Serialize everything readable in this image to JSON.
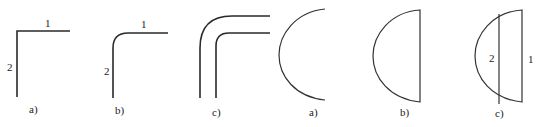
{
  "figure_left": {
    "panels": [
      {
        "id": "a",
        "caption": "a)",
        "shape": "sharp-corner",
        "labels": {
          "horizontal": "1",
          "vertical": "2"
        }
      },
      {
        "id": "b",
        "caption": "b)",
        "shape": "rounded-corner",
        "labels": {
          "horizontal": "1",
          "vertical": "2"
        }
      },
      {
        "id": "c",
        "caption": "c)",
        "shape": "double-rounded-corner"
      }
    ]
  },
  "figure_right": {
    "panels": [
      {
        "id": "a",
        "caption": "a)",
        "shape": "semicircle-arc"
      },
      {
        "id": "b",
        "caption": "b)",
        "shape": "half-disc"
      },
      {
        "id": "c",
        "caption": "c)",
        "shape": "half-disc-with-chord",
        "labels": {
          "inner_line": "2",
          "outer_line": "1"
        }
      }
    ]
  },
  "colors": {
    "line": "#2a2a2a",
    "background": "#ffffff"
  }
}
